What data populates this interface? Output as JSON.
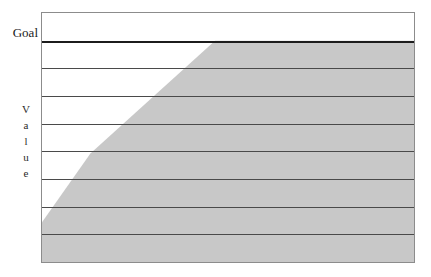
{
  "chart_data": {
    "type": "area",
    "title": "",
    "subtitle": "",
    "xlabel": "",
    "ylabel": "Value",
    "ylabel_letters": [
      "V",
      "a",
      "l",
      "u",
      "e"
    ],
    "annotations": [
      {
        "name": "goal-line",
        "label": "Goal",
        "y": 100,
        "style": "solid-dark-horizontal-rule"
      }
    ],
    "legend": [],
    "legend_position": "none",
    "grid": true,
    "gridlines_y": [
      87.5,
      75,
      62.5,
      50,
      37.5,
      25,
      12.5
    ],
    "xlim": [
      0,
      100
    ],
    "ylim": [
      0,
      112.5
    ],
    "xtick_labels": [],
    "ytick_labels": [],
    "series": [
      {
        "name": "Value",
        "fill_color": "#c8c8c8",
        "x": [
          0,
          13,
          46.5,
          100
        ],
        "values": [
          18,
          49,
          100,
          100
        ]
      }
    ]
  },
  "colors": {
    "area_fill": "#c8c8c8",
    "gridline": "#4a4a4a",
    "goal_line": "#1c1c1c",
    "frame_border": "#8c8c8c",
    "plot_background": "#ffffff",
    "page_background": "#ffffff",
    "text": "#1a1a1a"
  },
  "labels": {
    "goal": "Goal",
    "value_letters": [
      "V",
      "a",
      "l",
      "u",
      "e"
    ]
  }
}
